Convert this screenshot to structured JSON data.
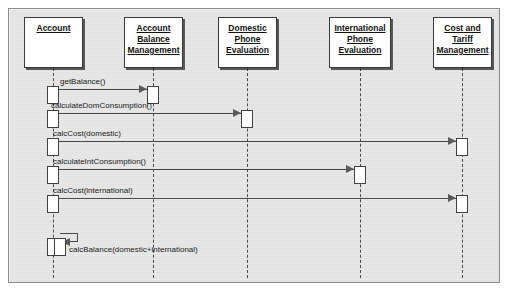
{
  "diagram": {
    "type": "uml-sequence-diagram",
    "background_color": "#e2e2e2",
    "line_color": "#4a4a4a",
    "box_fill": "#ffffff",
    "participants": [
      {
        "id": "account",
        "label": "Account",
        "x": 24,
        "y": 17,
        "w": 59,
        "h": 51,
        "lifeline_x": 53
      },
      {
        "id": "acct_balance",
        "label": "Account Balance Management",
        "x": 124,
        "y": 17,
        "w": 59,
        "h": 51,
        "lifeline_x": 153
      },
      {
        "id": "domestic_eval",
        "label": "Domestic Phone Evaluation",
        "x": 218,
        "y": 17,
        "w": 59,
        "h": 51,
        "lifeline_x": 247
      },
      {
        "id": "intl_eval",
        "label": "International Phone Evaluation",
        "x": 329,
        "y": 17,
        "w": 62,
        "h": 51,
        "lifeline_x": 360
      },
      {
        "id": "cost_tariff",
        "label": "Cost and Tariff Management",
        "x": 433,
        "y": 17,
        "w": 59,
        "h": 51,
        "lifeline_x": 462
      }
    ],
    "messages": [
      {
        "id": "m1",
        "label": "getBalance()",
        "from": "account",
        "to": "acct_balance",
        "y": 89,
        "label_x": 60,
        "label_y": 77,
        "kind": "call"
      },
      {
        "id": "m2",
        "label": "calculateDomConsumption()",
        "from": "account",
        "to": "domestic_eval",
        "y": 113,
        "label_x": 51,
        "label_y": 101,
        "kind": "call"
      },
      {
        "id": "m3",
        "label": "calcCost(domestic)",
        "from": "account",
        "to": "cost_tariff",
        "y": 141,
        "label_x": 53,
        "label_y": 129,
        "kind": "call"
      },
      {
        "id": "m4",
        "label": "calculateIntConsumption()",
        "from": "account",
        "to": "intl_eval",
        "y": 169,
        "label_x": 53,
        "label_y": 157,
        "kind": "call"
      },
      {
        "id": "m5",
        "label": "calcCost(international)",
        "from": "account",
        "to": "cost_tariff",
        "y": 198,
        "label_x": 53,
        "label_y": 186,
        "kind": "call"
      },
      {
        "id": "m6",
        "label": "calcBalance(domestic+international)",
        "from": "account",
        "to": "account",
        "y": 244,
        "label_x": 61,
        "label_y": 245,
        "kind": "self"
      }
    ],
    "activations": [
      {
        "id": "a1",
        "on": "account",
        "x": 47,
        "y": 86,
        "w": 12,
        "h": 18
      },
      {
        "id": "a2",
        "on": "account",
        "x": 47,
        "y": 110,
        "w": 12,
        "h": 18
      },
      {
        "id": "a3",
        "on": "account",
        "x": 47,
        "y": 138,
        "w": 12,
        "h": 18
      },
      {
        "id": "a4",
        "on": "account",
        "x": 47,
        "y": 166,
        "w": 12,
        "h": 18
      },
      {
        "id": "a5",
        "on": "account",
        "x": 47,
        "y": 195,
        "w": 12,
        "h": 18
      },
      {
        "id": "a6",
        "on": "account",
        "x": 47,
        "y": 238,
        "w": 12,
        "h": 18
      },
      {
        "id": "a7",
        "on": "account",
        "x": 54,
        "y": 238,
        "w": 12,
        "h": 18
      },
      {
        "id": "a8",
        "on": "acct_balance",
        "x": 147,
        "y": 86,
        "w": 12,
        "h": 18
      },
      {
        "id": "a9",
        "on": "domestic_eval",
        "x": 241,
        "y": 110,
        "w": 12,
        "h": 18
      },
      {
        "id": "a10",
        "on": "intl_eval",
        "x": 354,
        "y": 166,
        "w": 12,
        "h": 18
      },
      {
        "id": "a11",
        "on": "cost_tariff",
        "x": 456,
        "y": 138,
        "w": 12,
        "h": 18
      },
      {
        "id": "a12",
        "on": "cost_tariff",
        "x": 456,
        "y": 195,
        "w": 12,
        "h": 18
      }
    ]
  }
}
